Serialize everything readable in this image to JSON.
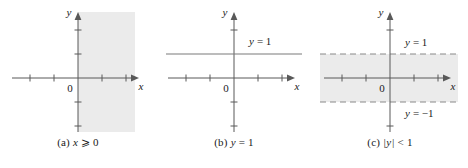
{
  "figure": {
    "background": "#ffffff",
    "shade_color": "#ebebeb",
    "axis_color": "#595959",
    "line_color": "#7a7a7a",
    "text_color": "#1a1a1a",
    "panels": [
      {
        "id": "a",
        "caption": "(a) x ⩾ 0",
        "caption_prefix": "(a)",
        "caption_var": "x",
        "caption_rest": "⩾ 0",
        "x_axis_label": "x",
        "y_axis_label": "y",
        "origin_label": "0",
        "x_ticks": [
          -2,
          -1,
          1,
          2
        ],
        "y_ticks": [
          -2,
          -1,
          1,
          2
        ],
        "region": {
          "type": "half-plane",
          "description": "x ≥ 0",
          "shaded": true,
          "boundary_style": "solid"
        },
        "labels": []
      },
      {
        "id": "b",
        "caption": "(b) y = 1",
        "caption_prefix": "(b)",
        "caption_var": "y",
        "caption_rest": "= 1",
        "x_axis_label": "x",
        "y_axis_label": "y",
        "origin_label": "0",
        "x_ticks": [
          -2,
          -1,
          1,
          2
        ],
        "y_ticks": [
          -2,
          -1,
          1,
          2
        ],
        "region": {
          "type": "line",
          "description": "y = 1",
          "shaded": false,
          "boundary_style": "solid"
        },
        "labels": [
          {
            "text": "y = 1",
            "var": "y",
            "rest": "= 1",
            "at_y": 1
          }
        ]
      },
      {
        "id": "c",
        "caption": "(c) |y| < 1",
        "caption_prefix": "(c)",
        "caption_var": "|y|",
        "caption_rest": "< 1",
        "x_axis_label": "x",
        "y_axis_label": "y",
        "origin_label": "0",
        "x_ticks": [
          -2,
          -1,
          1,
          2
        ],
        "y_ticks": [
          -2,
          -1,
          1,
          2
        ],
        "region": {
          "type": "strip",
          "description": "|y| < 1",
          "shaded": true,
          "boundary_style": "dashed"
        },
        "labels": [
          {
            "text": "y = 1",
            "var": "y",
            "rest": "= 1",
            "at_y": 1
          },
          {
            "text": "y = −1",
            "var": "y",
            "rest": "= −1",
            "at_y": -1
          }
        ]
      }
    ]
  }
}
